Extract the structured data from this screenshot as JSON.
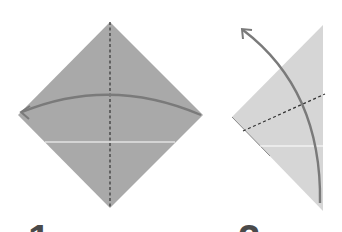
{
  "diagram": {
    "type": "origami-instructions",
    "colors": {
      "paper_front": "#a9a9a9",
      "paper_back": "#d6d6d6",
      "fold_arrow": "#7a7a7a",
      "valley_fold_line": "#333333",
      "crease_line": "#ffffff",
      "step_number": "#4a4a4a"
    },
    "steps": [
      {
        "number": "1",
        "shape": "square-diamond",
        "crease": "vertical valley fold (dashed)",
        "action": "fold right corner to left corner along dashed line"
      },
      {
        "number": "2",
        "shape": "triangle",
        "crease": "diagonal valley fold (dashed)",
        "action": "fold bottom point up and to the left"
      }
    ]
  }
}
